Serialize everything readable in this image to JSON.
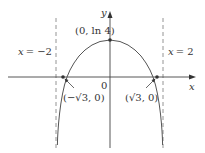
{
  "diagram": {
    "function": "y = ln(4 - x^2)",
    "axes": {
      "x_label": "x",
      "y_label": "y",
      "origin_label": "0"
    },
    "asymptotes": [
      {
        "label_var": "x",
        "label_eq": "= −2",
        "x": -2
      },
      {
        "label_var": "x",
        "label_eq": "= 2",
        "x": 2
      }
    ],
    "points": [
      {
        "label": "(0, ln 4)",
        "x": 0,
        "y": 1.386
      },
      {
        "label_left": "(−",
        "label_sqrt": "√3",
        "label_right": ", 0)",
        "x": -1.732,
        "y": 0
      },
      {
        "label_left": "(",
        "label_sqrt": "√3",
        "label_right": ", 0)",
        "x": 1.732,
        "y": 0
      }
    ],
    "colors": {
      "curve": "#555555",
      "axes": "#444444",
      "asymptote": "#777777",
      "text": "#333333"
    }
  }
}
